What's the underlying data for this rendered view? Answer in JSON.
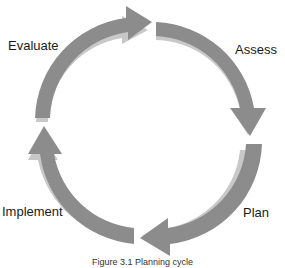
{
  "diagram": {
    "stages": [
      {
        "label": "Assess"
      },
      {
        "label": "Plan"
      },
      {
        "label": "Implement"
      },
      {
        "label": "Evaluate"
      }
    ],
    "colors": {
      "arrow": "#8c8c8c",
      "arrow_shadow": "#c8c8c8",
      "background": "#ffffff"
    },
    "caption": "Figure 3.1 Planning cycle"
  }
}
